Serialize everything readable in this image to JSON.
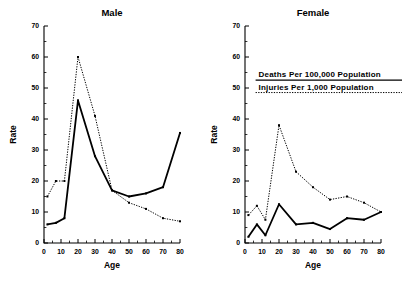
{
  "figure": {
    "background": "#ffffff",
    "ink_color": "#000000"
  },
  "legend": {
    "position": "upper-center-of-female-panel",
    "entries": [
      {
        "label": "Deaths Per 100,000 Population",
        "style": "solid"
      },
      {
        "label": "Injuries Per 1,000 Population",
        "style": "dotted"
      }
    ]
  },
  "axes": {
    "xlabel": "Age",
    "ylabel": "Rate",
    "xlim": [
      0,
      80
    ],
    "ylim": [
      0,
      70
    ],
    "xticks": [
      0,
      10,
      20,
      30,
      40,
      50,
      60,
      70,
      80
    ],
    "yticks": [
      0,
      10,
      20,
      30,
      40,
      50,
      60,
      70
    ],
    "xtick_labels": [
      "0",
      "10",
      "20",
      "30",
      "40",
      "50",
      "60",
      "70",
      "80"
    ],
    "ytick_labels": [
      "0",
      "10",
      "20",
      "30",
      "40",
      "50",
      "60",
      "70"
    ],
    "minor_tick_step_x": 5,
    "minor_tick_step_y": 5,
    "grid": false
  },
  "chart_data": [
    {
      "type": "line",
      "title": "Male",
      "xlabel": "Age",
      "ylabel": "Rate",
      "xlim": [
        0,
        80
      ],
      "ylim": [
        0,
        70
      ],
      "x": [
        2,
        7,
        12,
        20,
        30,
        40,
        50,
        60,
        70,
        80
      ],
      "grid": false,
      "legend_position": "in-female-panel",
      "series": [
        {
          "name": "Deaths Per 100,000 Population",
          "style": "solid",
          "values": [
            6,
            6.5,
            8,
            46,
            28,
            17,
            15,
            16,
            18,
            35.5
          ]
        },
        {
          "name": "Injuries Per 1,000 Population",
          "style": "dotted",
          "values": [
            15,
            20,
            20,
            60,
            41,
            17,
            13,
            11,
            8,
            7
          ]
        }
      ]
    },
    {
      "type": "line",
      "title": "Female",
      "xlabel": "Age",
      "ylabel": "Rate",
      "xlim": [
        0,
        80
      ],
      "ylim": [
        0,
        70
      ],
      "x": [
        2,
        7,
        12,
        20,
        30,
        40,
        50,
        60,
        70,
        80
      ],
      "grid": false,
      "legend_position": "upper-center",
      "series": [
        {
          "name": "Deaths Per 100,000 Population",
          "style": "solid",
          "values": [
            2,
            6,
            2.5,
            12.5,
            6,
            6.5,
            4.5,
            8,
            7.5,
            10
          ]
        },
        {
          "name": "Injuries Per 1,000 Population",
          "style": "dotted",
          "values": [
            9,
            12,
            7.5,
            38,
            23,
            18,
            14,
            15,
            13,
            10
          ]
        }
      ]
    }
  ]
}
